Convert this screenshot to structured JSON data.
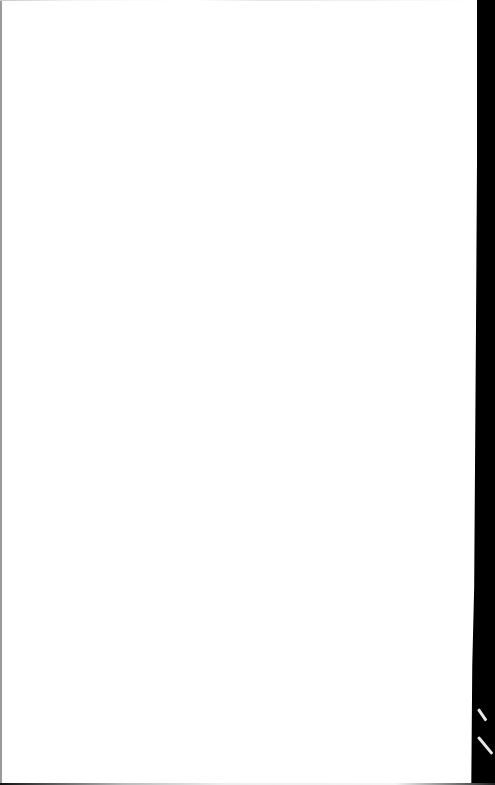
{
  "document": {
    "type": "blank-scanned-page",
    "text": "",
    "colors": {
      "page": "#ffffff",
      "background": "#000000",
      "left_edge": "#9a9a9a"
    }
  }
}
